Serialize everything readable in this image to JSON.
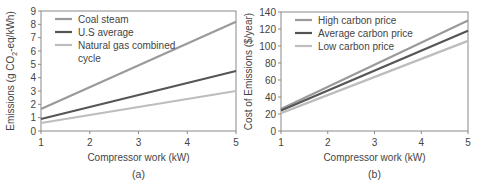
{
  "chart_data": [
    {
      "type": "line",
      "panel_label": "(a)",
      "title": "",
      "xlabel": "Compressor work (kW)",
      "ylabel": "Emissions (g CO2-eq/kWh)",
      "ylabel_parts": {
        "prefix": "Emissions (g CO",
        "sub": "2",
        "suffix": "-eq/kWh)"
      },
      "x": [
        1,
        5
      ],
      "xticks": [
        "1",
        "2",
        "3",
        "4",
        "5"
      ],
      "yticks": [
        "0",
        "1",
        "2",
        "3",
        "4",
        "5",
        "6",
        "7",
        "8",
        "9"
      ],
      "xlim": [
        1,
        5
      ],
      "ylim": [
        0,
        9
      ],
      "grid": false,
      "legend_position": "upper left",
      "series": [
        {
          "name": "Coal steam",
          "values": [
            1.65,
            8.2
          ],
          "color": "#9a9a9a",
          "width": 2.2
        },
        {
          "name": "U.S average",
          "values": [
            0.9,
            4.5
          ],
          "color": "#555555",
          "width": 2.2
        },
        {
          "name": "Natural gas combined cycle",
          "values": [
            0.6,
            3.0
          ],
          "color": "#bdbdbd",
          "width": 2.2
        }
      ],
      "legend_lines": [
        [
          "Coal steam"
        ],
        [
          "U.S average"
        ],
        [
          "Natural gas combined",
          "cycle"
        ]
      ]
    },
    {
      "type": "line",
      "panel_label": "(b)",
      "title": "",
      "xlabel": "Compressor work (kW)",
      "ylabel": "Cost of  Emissions ($/year)",
      "x": [
        1,
        5
      ],
      "xticks": [
        "1",
        "2",
        "3",
        "4",
        "5"
      ],
      "yticks": [
        "0",
        "20",
        "40",
        "60",
        "80",
        "100",
        "120",
        "140"
      ],
      "xlim": [
        1,
        5
      ],
      "ylim": [
        0,
        140
      ],
      "grid": false,
      "legend_position": "upper left",
      "series": [
        {
          "name": "High carbon price",
          "values": [
            26,
            130
          ],
          "color": "#9a9a9a",
          "width": 2.2
        },
        {
          "name": "Average carbon price",
          "values": [
            24,
            118
          ],
          "color": "#555555",
          "width": 2.2
        },
        {
          "name": "Low carbon price",
          "values": [
            21,
            106
          ],
          "color": "#bdbdbd",
          "width": 2.2
        }
      ]
    }
  ]
}
